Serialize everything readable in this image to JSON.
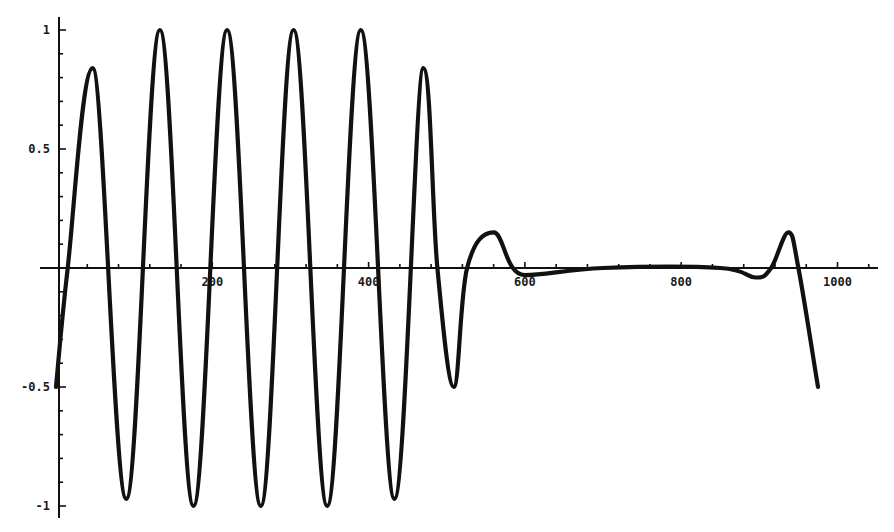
{
  "chart_data": {
    "type": "line",
    "title": "",
    "xlabel": "",
    "ylabel": "",
    "xlim": [
      0,
      1050
    ],
    "ylim": [
      -1.05,
      1.1
    ],
    "grid": false,
    "legend": null,
    "x_ticks": [
      200,
      400,
      600,
      800,
      1000
    ],
    "x_tick_labels": [
      "200",
      "400",
      "600",
      "800",
      "1000"
    ],
    "y_ticks": [
      -1,
      -0.5,
      0.5,
      1
    ],
    "y_tick_labels": [
      "-1",
      "-0.5",
      "0.5",
      "1"
    ],
    "series": [
      {
        "name": "signal",
        "color": "#111111",
        "x": [
          0,
          15,
          47,
          90,
          133,
          176,
          219,
          262,
          304,
          347,
          390,
          433,
          470,
          488,
          509,
          526,
          560,
          600,
          700,
          850,
          895,
          915,
          937,
          950,
          975
        ],
        "y": [
          -0.5,
          0.0,
          0.84,
          -0.97,
          1.0,
          -1.0,
          1.0,
          -1.0,
          1.0,
          -1.0,
          1.0,
          -0.97,
          0.84,
          0.0,
          -0.5,
          0.0,
          0.15,
          -0.03,
          0.0,
          0.0,
          -0.04,
          0.0,
          0.15,
          0.0,
          -0.5
        ]
      }
    ]
  }
}
